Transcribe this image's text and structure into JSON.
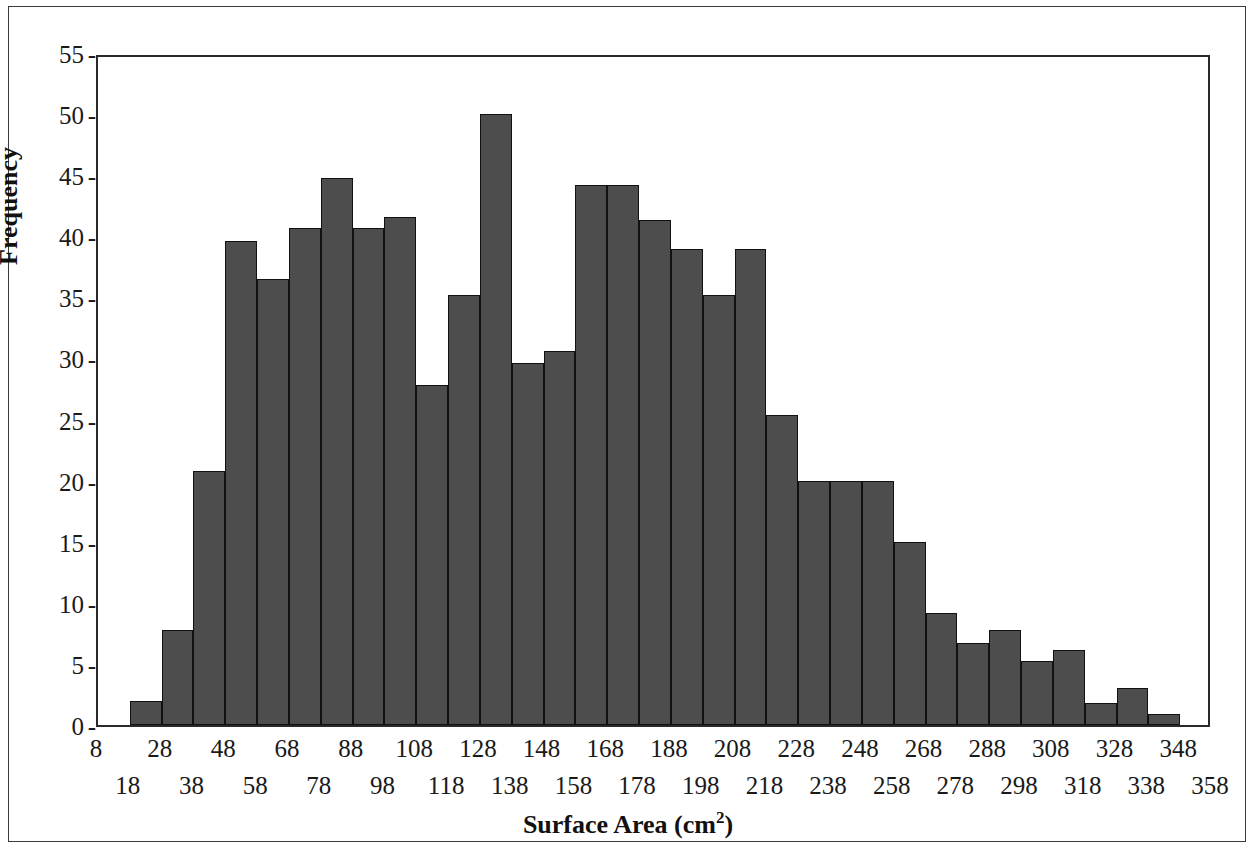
{
  "figure": {
    "type": "histogram",
    "bar_fill_color": "#4d4d4d",
    "bar_edge_color": "#111111",
    "frame_color": "#2a2a2a",
    "background_color": "#ffffff"
  },
  "axes": {
    "y_title": "Frequency",
    "x_title_main": "Surface Area (cm",
    "x_title_sup": "2",
    "x_title_close": ")",
    "y_ticks": [
      "55",
      "50",
      "45",
      "40",
      "35",
      "30",
      "25",
      "20",
      "15",
      "10",
      "5",
      "0"
    ],
    "y_tick_dash": "-",
    "x_ticks_top": [
      "8",
      "28",
      "48",
      "68",
      "88",
      "108",
      "128",
      "148",
      "168",
      "188",
      "208",
      "228",
      "248",
      "268",
      "288",
      "308",
      "328",
      "348"
    ],
    "x_ticks_bottom": [
      "18",
      "38",
      "58",
      "78",
      "98",
      "118",
      "138",
      "158",
      "178",
      "198",
      "218",
      "238",
      "258",
      "278",
      "298",
      "318",
      "338",
      "358"
    ]
  },
  "chart_data": {
    "type": "bar",
    "title": "",
    "xlabel": "Surface Area (cm2)",
    "ylabel": "Frequency",
    "ylim": [
      0,
      55
    ],
    "xlim": [
      8,
      358
    ],
    "grid": false,
    "legend": null,
    "bin_width": 10,
    "bin_starts": [
      18,
      28,
      38,
      48,
      58,
      68,
      78,
      88,
      98,
      108,
      118,
      128,
      138,
      148,
      158,
      168,
      178,
      188,
      198,
      208,
      218,
      228,
      238,
      248,
      258,
      268,
      278,
      288,
      298,
      308,
      318,
      328,
      338
    ],
    "categories": [
      "18-28",
      "28-38",
      "38-48",
      "48-58",
      "58-68",
      "68-78",
      "78-88",
      "88-98",
      "98-108",
      "108-118",
      "118-128",
      "128-138",
      "138-148",
      "148-158",
      "158-168",
      "168-178",
      "178-188",
      "188-198",
      "198-208",
      "208-218",
      "218-228",
      "228-238",
      "238-248",
      "248-258",
      "258-268",
      "268-278",
      "278-288",
      "288-298",
      "298-308",
      "308-318",
      "318-328",
      "328-338",
      "338-348"
    ],
    "values": [
      2,
      7.8,
      20.8,
      39.6,
      36.5,
      40.7,
      44.8,
      40.7,
      41.6,
      27.8,
      35.2,
      50,
      29.6,
      30.6,
      44.2,
      44.2,
      41.3,
      39,
      35.2,
      39,
      25.4,
      20,
      20,
      20,
      15,
      9.2,
      6.7,
      7.8,
      5.2,
      6.1,
      1.8,
      3,
      0.9
    ]
  }
}
